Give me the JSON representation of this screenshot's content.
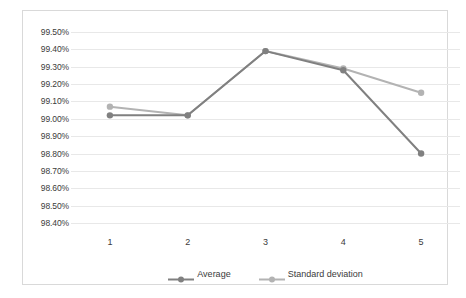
{
  "chart_data": {
    "type": "line",
    "title": "",
    "xlabel": "",
    "ylabel": "",
    "categories": [
      "1",
      "2",
      "3",
      "4",
      "5"
    ],
    "series": [
      {
        "name": "Average",
        "color": "#808080",
        "values": [
          99.02,
          99.02,
          99.39,
          99.28,
          98.8
        ]
      },
      {
        "name": "Standard deviation",
        "color": "#b3b3b3",
        "values": [
          99.07,
          99.02,
          99.39,
          99.29,
          99.15
        ]
      }
    ],
    "ylim": [
      98.4,
      99.5
    ],
    "ytick_labels": [
      "99.50%",
      "99.40%",
      "99.30%",
      "99.20%",
      "99.10%",
      "99.00%",
      "98.90%",
      "98.80%",
      "98.70%",
      "98.60%",
      "98.50%",
      "98.40%"
    ],
    "ytick_values": [
      99.5,
      99.4,
      99.3,
      99.2,
      99.1,
      99.0,
      98.9,
      98.8,
      98.7,
      98.6,
      98.5,
      98.4
    ],
    "grid": true,
    "grid_color": "#e8e8e8",
    "legend_position": "bottom",
    "plot_background": "#ffffff",
    "border_color": "#d9d9d9"
  },
  "legend": {
    "entries": [
      {
        "label": "Average"
      },
      {
        "label": "Standard deviation"
      }
    ]
  }
}
